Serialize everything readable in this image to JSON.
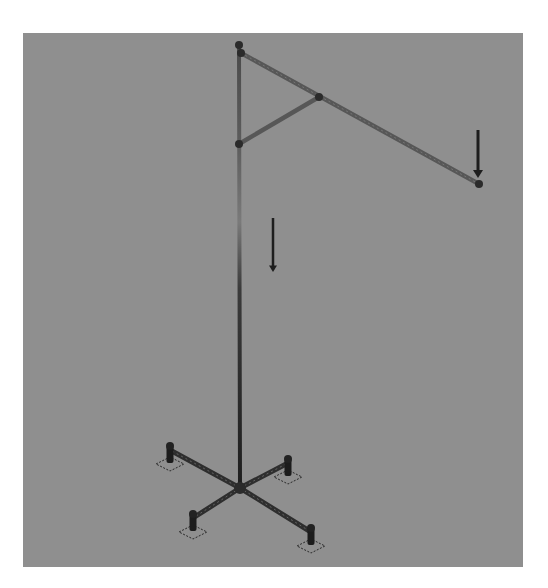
{
  "view": {
    "description": "Structural analysis model: vertical mast with inclined boom, brace, point load at boom tip, gravity indicator, cross-shaped base with four supports",
    "background_color": "#8f8f8f",
    "member_color": "#3a3a3a",
    "member_light_color": "#6e6e6e",
    "load_color": "#1e1e1e"
  },
  "model": {
    "nodes": [
      {
        "id": "mast-top"
      },
      {
        "id": "boom-root"
      },
      {
        "id": "brace-boom-joint"
      },
      {
        "id": "brace-mast-joint"
      },
      {
        "id": "boom-tip"
      },
      {
        "id": "base-center"
      },
      {
        "id": "foot-1"
      },
      {
        "id": "foot-2"
      },
      {
        "id": "foot-3"
      },
      {
        "id": "foot-4"
      }
    ],
    "members": [
      {
        "id": "mast",
        "from": "mast-top",
        "to": "base-center"
      },
      {
        "id": "boom",
        "from": "boom-root",
        "to": "boom-tip"
      },
      {
        "id": "brace",
        "from": "brace-mast-joint",
        "to": "brace-boom-joint"
      },
      {
        "id": "base-leg-1",
        "from": "base-center",
        "to": "foot-1"
      },
      {
        "id": "base-leg-2",
        "from": "base-center",
        "to": "foot-2"
      },
      {
        "id": "base-leg-3",
        "from": "base-center",
        "to": "foot-3"
      },
      {
        "id": "base-leg-4",
        "from": "base-center",
        "to": "foot-4"
      }
    ],
    "supports": [
      {
        "node": "foot-1"
      },
      {
        "node": "foot-2"
      },
      {
        "node": "foot-3"
      },
      {
        "node": "foot-4"
      }
    ],
    "loads": [
      {
        "id": "tip-point-load",
        "node": "boom-tip",
        "direction": "down"
      },
      {
        "id": "gravity-indicator",
        "direction": "down"
      }
    ]
  }
}
